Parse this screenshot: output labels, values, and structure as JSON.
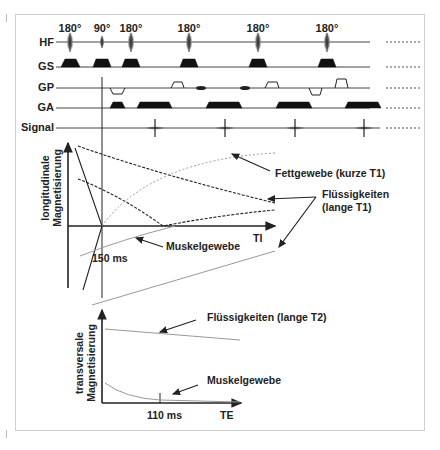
{
  "sequence": {
    "rows": {
      "hf": "HF",
      "gs": "GS",
      "gp": "GP",
      "ga": "GA",
      "signal": "Signal"
    },
    "pulses": [
      {
        "label": "180°",
        "x": 70
      },
      {
        "label": "90°",
        "x": 102
      },
      {
        "label": "180°",
        "x": 131
      },
      {
        "label": "180°",
        "x": 189
      },
      {
        "label": "180°",
        "x": 258
      },
      {
        "label": "180°",
        "x": 327
      }
    ],
    "continuation": "........"
  },
  "longitudinal": {
    "ylabel_line1": "longitudinale",
    "ylabel_line2": "Magnetisierung",
    "xlabel": "TI",
    "ti_marker": "150 ms",
    "annotations": {
      "fat": "Fettgewebe (kurze T1)",
      "fluid_line1": "Flüssigkeiten",
      "fluid_line2": "(lange T1)",
      "muscle": "Muskelgewebe"
    }
  },
  "transversal": {
    "ylabel_line1": "transversale",
    "ylabel_line2": "Magnetisierung",
    "xlabel": "TE",
    "te_marker": "110 ms",
    "annotations": {
      "fluid": "Flüssigkeiten (lange T2)",
      "muscle": "Muskelgewebe"
    }
  },
  "colors": {
    "ink": "#222222",
    "grey_curve": "#999999",
    "frame": "#cfcfcf"
  }
}
